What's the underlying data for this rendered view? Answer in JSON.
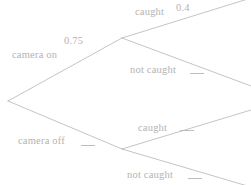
{
  "diagram": {
    "type": "probability-tree",
    "line_color": "#bdbdbd",
    "text_color": "#b3b3b3",
    "background": "#ffffff",
    "root": {
      "x": 8,
      "y": 101
    },
    "branches": [
      {
        "id": "camera-on",
        "label": "camera on",
        "probability": "0.75",
        "probability_filled": true,
        "node": {
          "x": 122,
          "y": 38
        },
        "children": [
          {
            "id": "caught-top",
            "label": "caught",
            "probability": "0.4",
            "probability_filled": true,
            "endpoint": {
              "x": 251,
              "y": 0
            }
          },
          {
            "id": "not-caught-top",
            "label": "not caught",
            "probability": "",
            "probability_filled": false,
            "endpoint": {
              "x": 251,
              "y": 85
            }
          }
        ]
      },
      {
        "id": "camera-off",
        "label": "camera off",
        "probability": "",
        "probability_filled": false,
        "node": {
          "x": 122,
          "y": 149
        },
        "children": [
          {
            "id": "caught-bottom",
            "label": "caught",
            "probability": "",
            "probability_filled": false,
            "endpoint": {
              "x": 251,
              "y": 111
            }
          },
          {
            "id": "not-caught-bottom",
            "label": "not caught",
            "probability": "",
            "probability_filled": false,
            "endpoint": {
              "x": 251,
              "y": 185
            }
          }
        ]
      }
    ]
  }
}
